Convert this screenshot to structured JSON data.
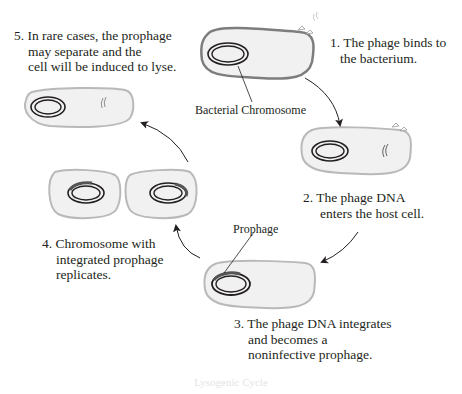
{
  "diagram": {
    "title": "Lysogenic Cycle",
    "colors": {
      "cell_fill": "#f1f1f1",
      "cell_outline": "#b9b9b9",
      "cell1_outline": "#7d7d7d",
      "chromosome": "#231f20",
      "prophage": "#555555",
      "arrow": "#231f20"
    },
    "steps": [
      {
        "id": 1,
        "lines": [
          "1. The phage binds to",
          "the bacterium."
        ]
      },
      {
        "id": 2,
        "lines": [
          "2. The phage DNA",
          "enters the host cell."
        ]
      },
      {
        "id": 3,
        "lines": [
          "3. The phage DNA integrates",
          "and becomes a",
          "noninfective prophage."
        ]
      },
      {
        "id": 4,
        "lines": [
          "4. Chromosome with",
          "integrated prophage",
          "replicates."
        ]
      },
      {
        "id": 5,
        "lines": [
          "5. In rare cases, the prophage",
          "may separate and the",
          "cell will be induced to lyse."
        ]
      }
    ],
    "callouts": {
      "bacterial_chromosome": "Bacterial Chromosome",
      "prophage": "Prophage"
    }
  }
}
